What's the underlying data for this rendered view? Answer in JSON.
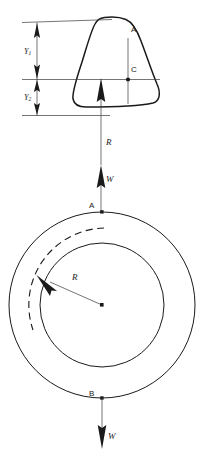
{
  "figure": {
    "type": "engineering-statics-diagram",
    "background_color": "#ffffff",
    "line_color": "#1a1a1a"
  },
  "upper_body": {
    "shape_label": "A",
    "centroid_label": "C",
    "description": "rounded trapezoidal cross-section"
  },
  "dimensions": {
    "upper": {
      "symbol": "Y",
      "subscript": "1",
      "text": "Y"
    },
    "lower": {
      "symbol": "Y",
      "subscript": "2",
      "text": "Y"
    }
  },
  "forces": {
    "reaction": {
      "label": "R",
      "direction": "up"
    },
    "weight_upper": {
      "label": "W",
      "direction": "up"
    },
    "weight_lower": {
      "label": "W",
      "direction": "down"
    }
  },
  "ring": {
    "radius_label": "R",
    "point_top": "A",
    "point_bottom": "B",
    "center_marker": "center-dot"
  }
}
